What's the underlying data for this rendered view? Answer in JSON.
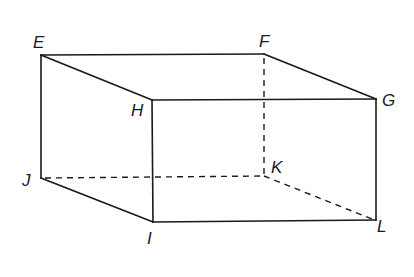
{
  "diagram": {
    "type": "cuboid",
    "vertices": {
      "E": {
        "x": 41,
        "y": 55,
        "label": "E",
        "lx": 33,
        "ly": 48
      },
      "F": {
        "x": 264,
        "y": 54,
        "label": "F",
        "lx": 259,
        "ly": 47
      },
      "G": {
        "x": 376,
        "y": 99,
        "label": "G",
        "lx": 382,
        "ly": 106
      },
      "H": {
        "x": 152,
        "y": 100,
        "label": "H",
        "lx": 131,
        "ly": 116
      },
      "I": {
        "x": 153,
        "y": 222,
        "label": "I",
        "lx": 147,
        "ly": 244
      },
      "J": {
        "x": 41,
        "y": 178,
        "label": "J",
        "lx": 22,
        "ly": 186
      },
      "K": {
        "x": 264,
        "y": 176,
        "label": "K",
        "lx": 271,
        "ly": 173
      },
      "L": {
        "x": 376,
        "y": 220,
        "label": "L",
        "lx": 377,
        "ly": 232
      }
    },
    "visible_edges": [
      "EF",
      "EH",
      "FG",
      "HG",
      "EJ",
      "HI",
      "GL",
      "JI",
      "IL"
    ],
    "hidden_edges": [
      "FK",
      "JK",
      "KL"
    ],
    "labels": {
      "E": "E",
      "F": "F",
      "G": "G",
      "H": "H",
      "I": "I",
      "J": "J",
      "K": "K",
      "L": "L"
    }
  }
}
